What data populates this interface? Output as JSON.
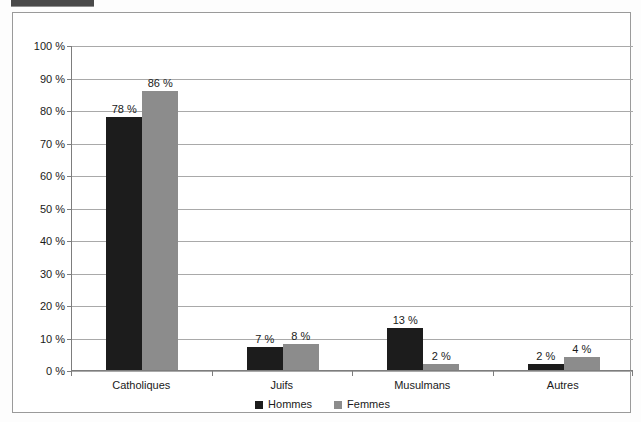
{
  "figure": {
    "header_strip_color": "#4a4a4a",
    "frame_border_color": "#9a9a9a"
  },
  "chart_data": {
    "type": "bar",
    "title": "",
    "xlabel": "",
    "ylabel": "",
    "categories": [
      "Catholiques",
      "Juifs",
      "Musulmans",
      "Autres"
    ],
    "series": [
      {
        "name": "Hommes",
        "color": "#1c1c1c",
        "values": [
          78,
          7,
          13,
          2
        ],
        "labels": [
          "78 %",
          "7 %",
          "13 %",
          "2 %"
        ]
      },
      {
        "name": "Femmes",
        "color": "#8c8c8c",
        "values": [
          86,
          8,
          2,
          4
        ],
        "labels": [
          "86 %",
          "8 %",
          "2 %",
          "4 %"
        ]
      }
    ],
    "ylim": [
      0,
      100
    ],
    "yticks": [
      0,
      10,
      20,
      30,
      40,
      50,
      60,
      70,
      80,
      90,
      100
    ],
    "ytick_labels": [
      "0 %",
      "10 %",
      "20 %",
      "30 %",
      "40 %",
      "50 %",
      "60 %",
      "70 %",
      "80 %",
      "90 %",
      "100 %"
    ],
    "grid": true,
    "legend_position": "bottom",
    "legend": [
      "Hommes",
      "Femmes"
    ]
  }
}
